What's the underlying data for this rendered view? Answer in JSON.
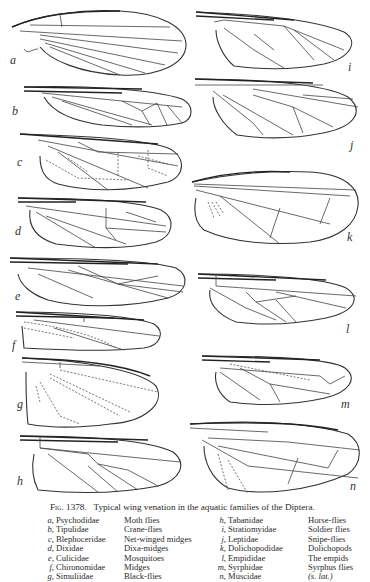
{
  "figure": {
    "number_label": "Fig. 1378.",
    "title": "Typical wing venation in the aquatic families of the Diptera.",
    "wings": [
      {
        "letter": "a",
        "family": "Psychodidae",
        "common": "Moth flies"
      },
      {
        "letter": "b",
        "family": "Tipulidae",
        "common": "Crane-flies"
      },
      {
        "letter": "c",
        "family": "Blephoceridae",
        "common": "Net-winged midges"
      },
      {
        "letter": "d",
        "family": "Dixidae",
        "common": "Dixa-midges"
      },
      {
        "letter": "e",
        "family": "Culicidae",
        "common": "Mosquitoes"
      },
      {
        "letter": "f",
        "family": "Chironomidae",
        "common": "Midges"
      },
      {
        "letter": "g",
        "family": "Simuliidae",
        "common": "Black-flies"
      },
      {
        "letter": "h",
        "family": "Tabanidae",
        "common": "Horse-flies"
      },
      {
        "letter": "i",
        "family": "Stratiomyidae",
        "common": "Soldier flies"
      },
      {
        "letter": "j",
        "family": "Leptidae",
        "common": "Snipe-flies"
      },
      {
        "letter": "k",
        "family": "Dolichopodidae",
        "common": "Dolichopods"
      },
      {
        "letter": "l",
        "family": "Empididae",
        "common": "The empids"
      },
      {
        "letter": "m",
        "family": "Syrphidae",
        "common": "Syrphus flies"
      },
      {
        "letter": "n",
        "family": "Muscidae",
        "common": "(s. lat.)"
      }
    ]
  }
}
